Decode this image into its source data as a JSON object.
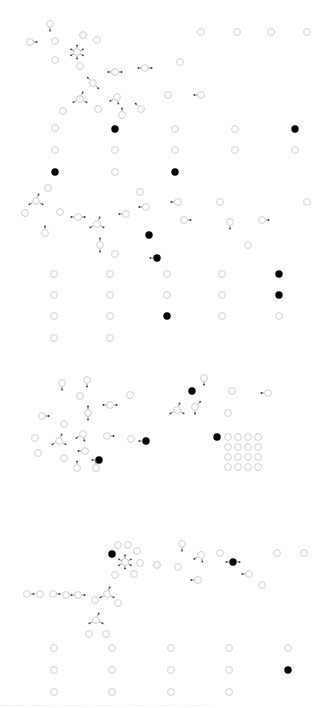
{
  "diagram": {
    "title": "",
    "colors": {
      "background": "#ffffff",
      "node_empty_stroke": "#c8c8c8",
      "node_filled": "#000000",
      "arrow": "#333333"
    },
    "node_radius": 3.4,
    "sections": [
      {
        "name": "section-1",
        "nodes": [
          {
            "x": 50,
            "y": 24,
            "filled": false,
            "arrow": "down"
          },
          {
            "x": 30,
            "y": 42,
            "filled": false,
            "arrow": "right"
          },
          {
            "x": 55,
            "y": 41,
            "filled": false
          },
          {
            "x": 83,
            "y": 35,
            "filled": false
          },
          {
            "x": 97,
            "y": 40,
            "filled": false
          },
          {
            "x": 77,
            "y": 52,
            "filled": false,
            "arrow": "star"
          },
          {
            "x": 55,
            "y": 60,
            "filled": false
          },
          {
            "x": 80,
            "y": 66,
            "filled": false
          },
          {
            "x": 115,
            "y": 72,
            "filled": false,
            "arrow": "left-right"
          },
          {
            "x": 145,
            "y": 68,
            "filled": false,
            "arrow": "left-right"
          },
          {
            "x": 93,
            "y": 83,
            "filled": false,
            "arrow": "diag"
          },
          {
            "x": 117,
            "y": 97,
            "filled": false,
            "arrow": "left-down"
          },
          {
            "x": 80,
            "y": 99,
            "filled": false,
            "arrow": "fork"
          },
          {
            "x": 63,
            "y": 111,
            "filled": false
          },
          {
            "x": 98,
            "y": 109,
            "filled": false
          },
          {
            "x": 122,
            "y": 115,
            "filled": false,
            "arrow": "up"
          },
          {
            "x": 141,
            "y": 109,
            "filled": false,
            "arrow": "up-left"
          },
          {
            "x": 55,
            "y": 128,
            "filled": false
          },
          {
            "x": 115,
            "y": 129,
            "filled": true
          },
          {
            "x": 55,
            "y": 150,
            "filled": false
          },
          {
            "x": 115,
            "y": 150,
            "filled": false
          },
          {
            "x": 55,
            "y": 172,
            "filled": true
          },
          {
            "x": 115,
            "y": 172,
            "filled": false
          },
          {
            "x": 201,
            "y": 32,
            "filled": false
          },
          {
            "x": 237,
            "y": 32,
            "filled": false
          },
          {
            "x": 271,
            "y": 32,
            "filled": false
          },
          {
            "x": 307,
            "y": 32,
            "filled": false
          },
          {
            "x": 180,
            "y": 62,
            "filled": false
          },
          {
            "x": 168,
            "y": 95,
            "filled": false
          },
          {
            "x": 201,
            "y": 95,
            "filled": false,
            "arrow": "left"
          },
          {
            "x": 175,
            "y": 129,
            "filled": false
          },
          {
            "x": 235,
            "y": 129,
            "filled": false
          },
          {
            "x": 295,
            "y": 129,
            "filled": true
          },
          {
            "x": 175,
            "y": 150,
            "filled": false
          },
          {
            "x": 235,
            "y": 150,
            "filled": false
          },
          {
            "x": 295,
            "y": 150,
            "filled": false
          },
          {
            "x": 175,
            "y": 172,
            "filled": true
          }
        ]
      },
      {
        "name": "section-2",
        "nodes": [
          {
            "x": 48,
            "y": 188,
            "filled": false
          },
          {
            "x": 36,
            "y": 201,
            "filled": false,
            "arrow": "fork"
          },
          {
            "x": 25,
            "y": 213,
            "filled": false
          },
          {
            "x": 60,
            "y": 212,
            "filled": false
          },
          {
            "x": 45,
            "y": 233,
            "filled": false,
            "arrow": "up"
          },
          {
            "x": 78,
            "y": 217,
            "filled": false,
            "arrow": "left-right"
          },
          {
            "x": 97,
            "y": 224,
            "filled": false,
            "arrow": "fork"
          },
          {
            "x": 100,
            "y": 245,
            "filled": false,
            "arrow": "up-down"
          },
          {
            "x": 115,
            "y": 254,
            "filled": false
          },
          {
            "x": 140,
            "y": 192,
            "filled": false
          },
          {
            "x": 146,
            "y": 207,
            "filled": false,
            "arrow": "left"
          },
          {
            "x": 126,
            "y": 214,
            "filled": false,
            "arrow": "left"
          },
          {
            "x": 149,
            "y": 235,
            "filled": true
          },
          {
            "x": 157,
            "y": 258,
            "filled": true,
            "arrow": "left"
          },
          {
            "x": 54,
            "y": 274,
            "filled": false
          },
          {
            "x": 110,
            "y": 274,
            "filled": false
          },
          {
            "x": 54,
            "y": 295,
            "filled": false
          },
          {
            "x": 110,
            "y": 295,
            "filled": false
          },
          {
            "x": 54,
            "y": 316,
            "filled": false
          },
          {
            "x": 110,
            "y": 316,
            "filled": false
          },
          {
            "x": 54,
            "y": 338,
            "filled": false
          },
          {
            "x": 110,
            "y": 338,
            "filled": false
          },
          {
            "x": 178,
            "y": 202,
            "filled": false,
            "arrow": "left"
          },
          {
            "x": 220,
            "y": 202,
            "filled": false
          },
          {
            "x": 307,
            "y": 202,
            "filled": false
          },
          {
            "x": 184,
            "y": 220,
            "filled": false,
            "arrow": "right"
          },
          {
            "x": 230,
            "y": 222,
            "filled": false,
            "arrow": "down"
          },
          {
            "x": 262,
            "y": 220,
            "filled": false,
            "arrow": "right"
          },
          {
            "x": 248,
            "y": 245,
            "filled": false
          },
          {
            "x": 167,
            "y": 274,
            "filled": false
          },
          {
            "x": 222,
            "y": 274,
            "filled": false
          },
          {
            "x": 279,
            "y": 274,
            "filled": true
          },
          {
            "x": 167,
            "y": 295,
            "filled": false
          },
          {
            "x": 222,
            "y": 295,
            "filled": false
          },
          {
            "x": 279,
            "y": 295,
            "filled": true
          },
          {
            "x": 167,
            "y": 316,
            "filled": true
          },
          {
            "x": 222,
            "y": 316,
            "filled": false
          },
          {
            "x": 279,
            "y": 316,
            "filled": false
          }
        ]
      },
      {
        "name": "section-3",
        "nodes": [
          {
            "x": 62,
            "y": 383,
            "filled": false,
            "arrow": "down"
          },
          {
            "x": 87,
            "y": 380,
            "filled": false,
            "arrow": "down"
          },
          {
            "x": 80,
            "y": 396,
            "filled": false
          },
          {
            "x": 110,
            "y": 405,
            "filled": false,
            "arrow": "left-right"
          },
          {
            "x": 130,
            "y": 395,
            "filled": false
          },
          {
            "x": 42,
            "y": 416,
            "filled": false,
            "arrow": "right"
          },
          {
            "x": 64,
            "y": 424,
            "filled": false
          },
          {
            "x": 88,
            "y": 413,
            "filled": false,
            "arrow": "up-down"
          },
          {
            "x": 35,
            "y": 438,
            "filled": false
          },
          {
            "x": 59,
            "y": 441,
            "filled": false,
            "arrow": "fork"
          },
          {
            "x": 83,
            "y": 434,
            "filled": false,
            "arrow": "left-down"
          },
          {
            "x": 107,
            "y": 436,
            "filled": false,
            "arrow": "right"
          },
          {
            "x": 131,
            "y": 439,
            "filled": false
          },
          {
            "x": 146,
            "y": 441,
            "filled": true,
            "arrow": "left"
          },
          {
            "x": 38,
            "y": 453,
            "filled": false
          },
          {
            "x": 64,
            "y": 458,
            "filled": false
          },
          {
            "x": 85,
            "y": 451,
            "filled": false,
            "arrow": "left"
          },
          {
            "x": 99,
            "y": 460,
            "filled": true,
            "arrow": "left"
          },
          {
            "x": 77,
            "y": 468,
            "filled": false,
            "arrow": "up"
          },
          {
            "x": 96,
            "y": 468,
            "filled": false,
            "arrow": "up"
          },
          {
            "x": 204,
            "y": 378,
            "filled": false,
            "arrow": "down"
          },
          {
            "x": 192,
            "y": 391,
            "filled": true
          },
          {
            "x": 232,
            "y": 391,
            "filled": false
          },
          {
            "x": 268,
            "y": 393,
            "filled": false,
            "arrow": "left"
          },
          {
            "x": 195,
            "y": 407,
            "filled": false,
            "arrow": "up-right"
          },
          {
            "x": 177,
            "y": 410,
            "filled": false,
            "arrow": "fork"
          },
          {
            "x": 228,
            "y": 413,
            "filled": false
          },
          {
            "x": 217,
            "y": 437,
            "filled": true
          }
        ],
        "grid": {
          "x0": 228,
          "y0": 437,
          "cols": 4,
          "rows": 4,
          "step": 10
        }
      },
      {
        "name": "section-4",
        "nodes": [
          {
            "x": 118,
            "y": 545,
            "filled": false
          },
          {
            "x": 128,
            "y": 545,
            "filled": false
          },
          {
            "x": 112,
            "y": 554,
            "filled": true
          },
          {
            "x": 125,
            "y": 562,
            "filled": false,
            "arrow": "star"
          },
          {
            "x": 137,
            "y": 551,
            "filled": false
          },
          {
            "x": 140,
            "y": 563,
            "filled": false
          },
          {
            "x": 157,
            "y": 565,
            "filled": false
          },
          {
            "x": 115,
            "y": 575,
            "filled": false
          },
          {
            "x": 134,
            "y": 574,
            "filled": false
          },
          {
            "x": 27,
            "y": 594,
            "filled": false,
            "arrow": "right"
          },
          {
            "x": 40,
            "y": 594,
            "filled": false
          },
          {
            "x": 53,
            "y": 594,
            "filled": false,
            "arrow": "right"
          },
          {
            "x": 66,
            "y": 595,
            "filled": false
          },
          {
            "x": 78,
            "y": 595,
            "filled": false,
            "arrow": "left-right"
          },
          {
            "x": 95,
            "y": 600,
            "filled": false
          },
          {
            "x": 107,
            "y": 594,
            "filled": false,
            "arrow": "fork"
          },
          {
            "x": 118,
            "y": 603,
            "filled": false
          },
          {
            "x": 96,
            "y": 620,
            "filled": false,
            "arrow": "fork"
          },
          {
            "x": 89,
            "y": 634,
            "filled": false
          },
          {
            "x": 106,
            "y": 634,
            "filled": false
          },
          {
            "x": 54,
            "y": 648,
            "filled": false
          },
          {
            "x": 112,
            "y": 648,
            "filled": false
          },
          {
            "x": 54,
            "y": 670,
            "filled": false
          },
          {
            "x": 112,
            "y": 670,
            "filled": false
          },
          {
            "x": 54,
            "y": 692,
            "filled": false
          },
          {
            "x": 112,
            "y": 692,
            "filled": false
          },
          {
            "x": 182,
            "y": 544,
            "filled": false,
            "arrow": "down"
          },
          {
            "x": 201,
            "y": 555,
            "filled": false,
            "arrow": "left-down"
          },
          {
            "x": 220,
            "y": 553,
            "filled": false
          },
          {
            "x": 233,
            "y": 562,
            "filled": true,
            "arrow": "left-right"
          },
          {
            "x": 178,
            "y": 567,
            "filled": false
          },
          {
            "x": 198,
            "y": 580,
            "filled": false,
            "arrow": "left"
          },
          {
            "x": 249,
            "y": 574,
            "filled": false,
            "arrow": "left"
          },
          {
            "x": 262,
            "y": 585,
            "filled": false
          },
          {
            "x": 277,
            "y": 553,
            "filled": false
          },
          {
            "x": 304,
            "y": 553,
            "filled": false
          },
          {
            "x": 171,
            "y": 648,
            "filled": false
          },
          {
            "x": 229,
            "y": 648,
            "filled": false
          },
          {
            "x": 288,
            "y": 648,
            "filled": false
          },
          {
            "x": 171,
            "y": 670,
            "filled": false
          },
          {
            "x": 229,
            "y": 670,
            "filled": false
          },
          {
            "x": 288,
            "y": 670,
            "filled": true
          },
          {
            "x": 171,
            "y": 692,
            "filled": false
          },
          {
            "x": 229,
            "y": 692,
            "filled": false
          }
        ]
      }
    ],
    "footer_text": "............................................................"
  }
}
